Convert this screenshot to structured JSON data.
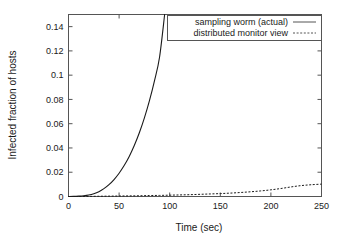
{
  "chart_data": {
    "type": "line",
    "title": "",
    "xlabel": "Time (sec)",
    "ylabel": "Infected fraction of hosts",
    "xlim": [
      0,
      250
    ],
    "ylim": [
      0,
      0.15
    ],
    "grid": false,
    "legend_position": "top-right-inside",
    "xticks": [
      "0",
      "50",
      "100",
      "150",
      "200",
      "250"
    ],
    "xtick_values": [
      0,
      50,
      100,
      150,
      200,
      250
    ],
    "yticks": [
      "0",
      "0.02",
      "0.04",
      "0.06",
      "0.08",
      "0.1",
      "0.12",
      "0.14"
    ],
    "ytick_values": [
      0,
      0.02,
      0.04,
      0.06,
      0.08,
      0.1,
      0.12,
      0.14
    ],
    "series": [
      {
        "name": "sampling worm (actual)",
        "style": "solid",
        "x": [
          0,
          5,
          10,
          15,
          20,
          25,
          30,
          35,
          40,
          45,
          50,
          55,
          60,
          65,
          70,
          75,
          80,
          85,
          90,
          95
        ],
        "values": [
          0.0,
          0.0001,
          0.0003,
          0.0006,
          0.0012,
          0.0023,
          0.004,
          0.0065,
          0.0098,
          0.014,
          0.0192,
          0.0255,
          0.033,
          0.042,
          0.0525,
          0.0648,
          0.079,
          0.0955,
          0.115,
          0.15
        ]
      },
      {
        "name": "distributed monitor view",
        "style": "dashed",
        "x": [
          0,
          10,
          20,
          30,
          40,
          50,
          60,
          70,
          80,
          90,
          100,
          110,
          120,
          130,
          140,
          150,
          160,
          170,
          180,
          190,
          200,
          210,
          220,
          230,
          240,
          250
        ],
        "values": [
          0.0,
          0.0,
          0.0001,
          0.0002,
          0.0003,
          0.0004,
          0.0005,
          0.0006,
          0.0008,
          0.0009,
          0.0011,
          0.0013,
          0.0015,
          0.0018,
          0.0021,
          0.0024,
          0.0028,
          0.0033,
          0.0039,
          0.0046,
          0.0055,
          0.0066,
          0.0079,
          0.009,
          0.0097,
          0.0102
        ]
      }
    ]
  },
  "legend": {
    "items": [
      {
        "label": "sampling worm (actual)",
        "style": "solid"
      },
      {
        "label": "distributed monitor view",
        "style": "dashed"
      }
    ]
  },
  "colors": {
    "background": "#ffffff",
    "axis": "#555555",
    "ink": "#1a1a1a"
  }
}
